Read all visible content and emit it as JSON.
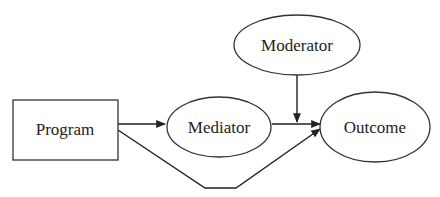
{
  "diagram": {
    "type": "moderated-mediation path diagram",
    "nodes": [
      {
        "id": "program",
        "label": "Program",
        "shape": "rectangle"
      },
      {
        "id": "mediator",
        "label": "Mediator",
        "shape": "ellipse"
      },
      {
        "id": "moderator",
        "label": "Moderator",
        "shape": "ellipse"
      },
      {
        "id": "outcome",
        "label": "Outcome",
        "shape": "ellipse"
      }
    ],
    "edges": [
      {
        "from": "program",
        "to": "mediator",
        "style": "arrow"
      },
      {
        "from": "mediator",
        "to": "outcome",
        "style": "arrow"
      },
      {
        "from": "program",
        "to": "outcome",
        "style": "arrow",
        "route": "bent-below"
      },
      {
        "from": "moderator",
        "to": "mediator-outcome-path",
        "style": "arrow"
      }
    ],
    "colors": {
      "stroke": "#333333",
      "background": "#ffffff",
      "text": "#222222"
    }
  }
}
